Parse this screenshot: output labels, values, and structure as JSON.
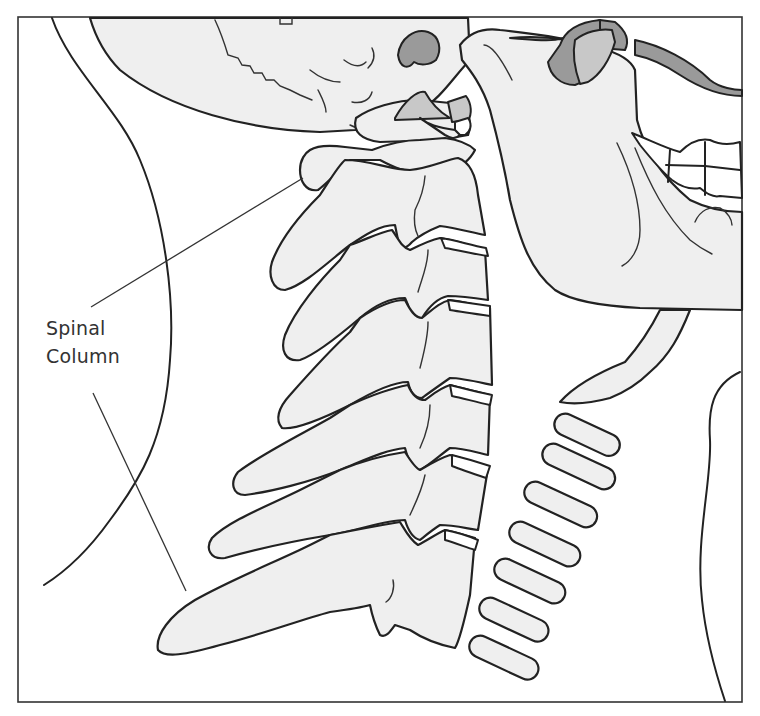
{
  "figure": {
    "label": {
      "line1": "Spinal",
      "line2": "Column"
    }
  },
  "colors": {
    "bone_fill": "#efefef",
    "outline": "#222222",
    "shadow_dark": "#9a9a9a",
    "shadow_mid": "#c8c8c8",
    "background": "#ffffff"
  }
}
